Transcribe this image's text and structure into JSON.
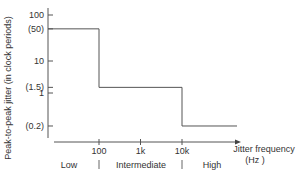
{
  "chart_data": {
    "type": "line",
    "title": "",
    "xlabel": "Jitter frequency",
    "xlabel_unit": "(Hz )",
    "ylabel": "Peak-to-peak jitter (in clock periods)",
    "x_scale": "log",
    "y_scale": "log",
    "xlim": [
      10,
      100000
    ],
    "ylim": [
      0.1,
      100
    ],
    "x_ticks": [
      {
        "value": 100,
        "label": "100"
      },
      {
        "value": 1000,
        "label": "1k"
      },
      {
        "value": 10000,
        "label": "10k"
      }
    ],
    "y_ticks": [
      {
        "value": 100,
        "label": "100"
      },
      {
        "value": 50,
        "label": "(50)"
      },
      {
        "value": 10,
        "label": "10"
      },
      {
        "value": 1.5,
        "label": "(1.5)"
      },
      {
        "value": 1,
        "label": "1"
      },
      {
        "value": 0.2,
        "label": "(0.2)"
      }
    ],
    "regions": [
      {
        "label": "Low"
      },
      {
        "label": "Intermediate"
      },
      {
        "label": "High"
      }
    ],
    "series": [
      {
        "name": "jitter tolerance mask",
        "step": true,
        "points": [
          {
            "x": 10,
            "y": 50
          },
          {
            "x": 100,
            "y": 50
          },
          {
            "x": 100,
            "y": 1.5
          },
          {
            "x": 10000,
            "y": 1.5
          },
          {
            "x": 10000,
            "y": 0.2
          },
          {
            "x": 100000,
            "y": 0.2
          }
        ]
      }
    ],
    "grid": false,
    "legend": "none"
  }
}
